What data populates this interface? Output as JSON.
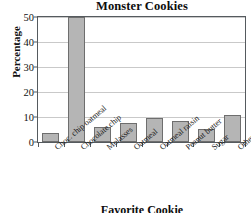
{
  "chart_data": {
    "type": "bar",
    "title": "Monster Cookies",
    "xlabel": "Favorite Cookie",
    "ylabel": "Percentage",
    "categories": [
      "Choc. chip oatmeal",
      "Chocolate chip",
      "Molasses",
      "Oatmeal",
      "Oatmeal raisin",
      "Peanut butter",
      "Sugar",
      "Others"
    ],
    "values": [
      3.5,
      50,
      6,
      7.8,
      9.5,
      8.5,
      5.3,
      11
    ],
    "ylim": [
      0,
      50
    ],
    "yticks": [
      0,
      10,
      20,
      30,
      40,
      50
    ],
    "ytick_labels": [
      "0",
      "10",
      "20",
      "30",
      "40",
      "50"
    ],
    "grid": true,
    "legend": false,
    "bar_color": "#b5b5b5",
    "bar_border_color": "#6e6e6e",
    "grid_color": "#c9c9c9",
    "axis_color": "#555a5e",
    "background": "#ffffff"
  }
}
